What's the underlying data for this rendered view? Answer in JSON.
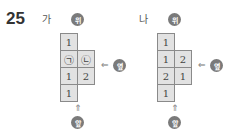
{
  "question_number": "25",
  "figures": [
    {
      "label": "가",
      "top_badge": "위",
      "side_badge": "옆",
      "front_badge": "앞",
      "cells": [
        {
          "row": 0,
          "col": 0,
          "value": "1"
        },
        {
          "row": 1,
          "col": 0,
          "value": "㉠"
        },
        {
          "row": 1,
          "col": 1,
          "value": "㉡"
        },
        {
          "row": 2,
          "col": 0,
          "value": "1"
        },
        {
          "row": 2,
          "col": 1,
          "value": "2"
        },
        {
          "row": 3,
          "col": 0,
          "value": "1"
        }
      ]
    },
    {
      "label": "나",
      "top_badge": "위",
      "side_badge": "옆",
      "front_badge": "앞",
      "cells": [
        {
          "row": 0,
          "col": 0,
          "value": "1"
        },
        {
          "row": 1,
          "col": 0,
          "value": "1"
        },
        {
          "row": 1,
          "col": 1,
          "value": "2"
        },
        {
          "row": 2,
          "col": 0,
          "value": "2"
        },
        {
          "row": 2,
          "col": 1,
          "value": "1"
        },
        {
          "row": 3,
          "col": 0,
          "value": "1"
        }
      ]
    }
  ],
  "colors": {
    "cell_fill": "#e2e2e2",
    "cell_border": "#8a8a8a",
    "badge": "#7a7a7a"
  }
}
